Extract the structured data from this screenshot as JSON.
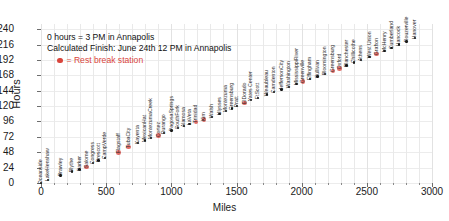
{
  "chart_data": {
    "type": "scatter",
    "title": "",
    "xlabel": "Miles",
    "ylabel": "Hours",
    "xlim": [
      0,
      3000
    ],
    "ylim": [
      0,
      248
    ],
    "xticks": [
      0,
      500,
      1000,
      1500,
      2000,
      2500,
      3000
    ],
    "yticks": [
      0,
      24,
      48,
      72,
      96,
      120,
      144,
      168,
      192,
      216,
      240
    ],
    "grid": true,
    "legend_position": "upper-left",
    "annotations": [
      "0 hours = 3 PM in Annapolis",
      "Calculated Finish: June 24th 12 PM in Annapolis"
    ],
    "legend": [
      {
        "label": "= Rest break station",
        "color": "#d9453c",
        "marker": "circle"
      }
    ],
    "series": [
      {
        "name": "Route stations",
        "color": "#111111",
        "rest_color": "#d9453c",
        "points": [
          {
            "label": "Oceanside",
            "x": 0,
            "y": 0,
            "rest": false
          },
          {
            "label": "LakeHenshaw",
            "x": 55,
            "y": 5,
            "rest": false
          },
          {
            "label": "Brawley",
            "x": 150,
            "y": 12,
            "rest": false
          },
          {
            "label": "Blythe",
            "x": 240,
            "y": 18,
            "rest": false
          },
          {
            "label": "Parker",
            "x": 295,
            "y": 21,
            "rest": false
          },
          {
            "label": "Salome",
            "x": 350,
            "y": 25,
            "rest": true
          },
          {
            "label": "Congress",
            "x": 400,
            "y": 31,
            "rest": false
          },
          {
            "label": "Prescott",
            "x": 440,
            "y": 35,
            "rest": false
          },
          {
            "label": "CampVerde",
            "x": 490,
            "y": 39,
            "rest": false
          },
          {
            "label": "Flagstaff",
            "x": 595,
            "y": 48,
            "rest": true
          },
          {
            "label": "TubaCity",
            "x": 670,
            "y": 56,
            "rest": true
          },
          {
            "label": "Kayenta",
            "x": 745,
            "y": 62,
            "rest": false
          },
          {
            "label": "MexicanHat",
            "x": 800,
            "y": 66,
            "rest": false
          },
          {
            "label": "MontezumaCreek",
            "x": 845,
            "y": 70,
            "rest": false
          },
          {
            "label": "Cortez",
            "x": 900,
            "y": 74,
            "rest": true
          },
          {
            "label": "Durango",
            "x": 945,
            "y": 78,
            "rest": false
          },
          {
            "label": "PagosaSprings",
            "x": 1000,
            "y": 82,
            "rest": false
          },
          {
            "label": "SouthFork",
            "x": 1050,
            "y": 86,
            "rest": false
          },
          {
            "label": "Alamosa",
            "x": 1095,
            "y": 89,
            "rest": false
          },
          {
            "label": "LaVeta",
            "x": 1140,
            "y": 92,
            "rest": false
          },
          {
            "label": "Trinidad",
            "x": 1190,
            "y": 95,
            "rest": true
          },
          {
            "label": "Kim",
            "x": 1250,
            "y": 99,
            "rest": true
          },
          {
            "label": "Walsh",
            "x": 1310,
            "y": 103,
            "rest": false
          },
          {
            "label": "Ulysses",
            "x": 1370,
            "y": 108,
            "rest": false
          },
          {
            "label": "Montezuma",
            "x": 1420,
            "y": 112,
            "rest": false
          },
          {
            "label": "Greensburg",
            "x": 1465,
            "y": 116,
            "rest": false
          },
          {
            "label": "Pratt",
            "x": 1505,
            "y": 120,
            "rest": false
          },
          {
            "label": "ElDorado",
            "x": 1560,
            "y": 125,
            "rest": true
          },
          {
            "label": "Yates Center",
            "x": 1610,
            "y": 129,
            "rest": false
          },
          {
            "label": "FtScott",
            "x": 1665,
            "y": 133,
            "rest": false
          },
          {
            "label": "Weaubleau",
            "x": 1735,
            "y": 138,
            "rest": false
          },
          {
            "label": "Camdenton",
            "x": 1790,
            "y": 142,
            "rest": false
          },
          {
            "label": "JeffersonCity",
            "x": 1845,
            "y": 146,
            "rest": false
          },
          {
            "label": "Washington",
            "x": 1905,
            "y": 150,
            "rest": false
          },
          {
            "label": "MississippiRiver",
            "x": 1960,
            "y": 154,
            "rest": false
          },
          {
            "label": "Greenville",
            "x": 2010,
            "y": 158,
            "rest": true
          },
          {
            "label": "Effingham",
            "x": 2065,
            "y": 162,
            "rest": false
          },
          {
            "label": "Sullivan",
            "x": 2120,
            "y": 166,
            "rest": false
          },
          {
            "label": "Bloomington",
            "x": 2180,
            "y": 170,
            "rest": false
          },
          {
            "label": "Greensburg",
            "x": 2240,
            "y": 175,
            "rest": true
          },
          {
            "label": "Oxford",
            "x": 2290,
            "y": 179,
            "rest": true
          },
          {
            "label": "Blanchester",
            "x": 2345,
            "y": 183,
            "rest": false
          },
          {
            "label": "Chillicothe",
            "x": 2400,
            "y": 188,
            "rest": false
          },
          {
            "label": "Athens",
            "x": 2455,
            "y": 192,
            "rest": false
          },
          {
            "label": "West Union",
            "x": 2520,
            "y": 197,
            "rest": false
          },
          {
            "label": "Grafton",
            "x": 2575,
            "y": 201,
            "rest": true
          },
          {
            "label": "McHenry",
            "x": 2635,
            "y": 206,
            "rest": false
          },
          {
            "label": "Cumberland",
            "x": 2690,
            "y": 211,
            "rest": false
          },
          {
            "label": "Hancock",
            "x": 2745,
            "y": 216,
            "rest": false
          },
          {
            "label": "Rouzerville",
            "x": 2805,
            "y": 221,
            "rest": false
          },
          {
            "label": "Hanover",
            "x": 2870,
            "y": 226,
            "rest": false
          }
        ]
      }
    ]
  }
}
